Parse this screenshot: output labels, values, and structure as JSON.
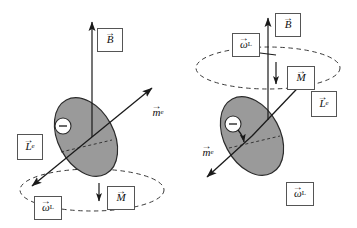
{
  "figure": {
    "background": "#ffffff",
    "disc_fill": "#9a9a9a",
    "disc_stroke": "#2b2b2b",
    "line_color": "#1a1a1a",
    "dash_color": "#3a3a3a",
    "label_border": "#555555"
  },
  "panels": [
    {
      "id": "left",
      "name": "panel-left",
      "description": "Magnetic moment tilted up-right, angular momentum down-left, precession circle below the orbit",
      "charge_symbol": "−",
      "labels": [
        {
          "id": "B",
          "symbol": "B",
          "subscript": "",
          "boxed": true,
          "x": 97,
          "y": 28,
          "w": 26,
          "h": 24
        },
        {
          "id": "m_e",
          "symbol": "m",
          "subscript": "e",
          "boxed": false,
          "x": 146,
          "y": 103,
          "w": 24,
          "h": 18
        },
        {
          "id": "L_e",
          "symbol": "L",
          "subscript": "e",
          "boxed": true,
          "x": 17,
          "y": 134,
          "w": 26,
          "h": 26
        },
        {
          "id": "omega_L",
          "symbol": "ω",
          "subscript": "L",
          "boxed": true,
          "x": 34,
          "y": 196,
          "w": 28,
          "h": 24
        },
        {
          "id": "M",
          "symbol": "M",
          "subscript": "",
          "boxed": true,
          "x": 107,
          "y": 186,
          "w": 28,
          "h": 24
        }
      ]
    },
    {
      "id": "right",
      "name": "panel-right",
      "description": "Precession circle above the orbit, angular momentum up-right, magnetic moment down-left",
      "charge_symbol": "−",
      "labels": [
        {
          "id": "B",
          "symbol": "B",
          "subscript": "",
          "boxed": true,
          "x": 275,
          "y": 13,
          "w": 26,
          "h": 24
        },
        {
          "id": "omega_L1",
          "symbol": "ω",
          "subscript": "L",
          "boxed": true,
          "x": 232,
          "y": 33,
          "w": 28,
          "h": 24
        },
        {
          "id": "M",
          "symbol": "M",
          "subscript": "",
          "boxed": true,
          "x": 287,
          "y": 66,
          "w": 28,
          "h": 24
        },
        {
          "id": "L_e",
          "symbol": "L",
          "subscript": "e",
          "boxed": true,
          "x": 311,
          "y": 91,
          "w": 26,
          "h": 26
        },
        {
          "id": "m_e",
          "symbol": "m",
          "subscript": "e",
          "boxed": false,
          "x": 196,
          "y": 143,
          "w": 24,
          "h": 18
        },
        {
          "id": "omega_L2",
          "symbol": "ω",
          "subscript": "L",
          "boxed": true,
          "x": 286,
          "y": 182,
          "w": 28,
          "h": 24
        }
      ]
    }
  ],
  "glyphs": {
    "vector_arrow": "→",
    "minus": "−"
  }
}
